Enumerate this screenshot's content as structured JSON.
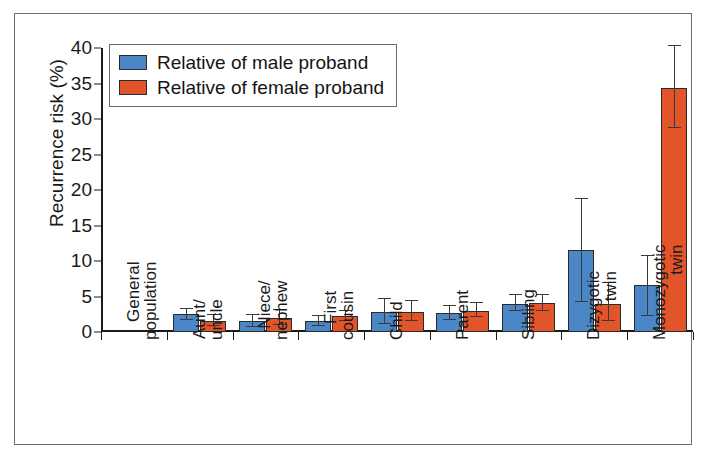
{
  "chart_data": {
    "type": "bar",
    "title": "",
    "subtitle": "",
    "xlabel": "",
    "ylabel": "Recurrence risk (%)",
    "ylim": [
      0,
      40
    ],
    "ytick_step": 5,
    "yticks": [
      "0",
      "5",
      "10",
      "15",
      "20",
      "25",
      "30",
      "35",
      "40"
    ],
    "grid": false,
    "legend_position": "top-left",
    "categories": [
      "General population",
      "Aunt/uncle",
      "Niece/nephew",
      "First cousin",
      "Child",
      "Parent",
      "Sibling",
      "Dizygotic twin",
      "Monozygotic twin"
    ],
    "category_lines": [
      [
        "General",
        "population"
      ],
      [
        "Aunt/",
        "uncle"
      ],
      [
        "Niece/",
        "nephew"
      ],
      [
        "First",
        "cousin"
      ],
      [
        "Child",
        ""
      ],
      [
        "Parent",
        ""
      ],
      [
        "Sibling",
        ""
      ],
      [
        "Dizygotic",
        "twin"
      ],
      [
        "Monozygotic",
        "twin"
      ]
    ],
    "series": [
      {
        "name": "Relative of male proband",
        "color": "#4b86c6",
        "values": [
          0,
          2.5,
          1.5,
          1.5,
          2.8,
          2.7,
          4.0,
          11.5,
          6.6
        ],
        "err_low": [
          0,
          1.7,
          0.7,
          0.9,
          1.1,
          1.7,
          2.9,
          4.2,
          2.3
        ],
        "err_high": [
          0,
          3.3,
          2.4,
          2.2,
          4.6,
          3.7,
          5.2,
          18.8,
          10.7
        ]
      },
      {
        "name": "Relative of female proband",
        "color": "#e2552a",
        "values": [
          0,
          1.5,
          2.0,
          2.3,
          2.8,
          3.0,
          4.1,
          4.0,
          34.4
        ],
        "err_low": [
          0,
          0.8,
          1.0,
          1.6,
          1.5,
          2.1,
          3.0,
          1.6,
          28.7
        ],
        "err_high": [
          0,
          2.4,
          3.1,
          3.0,
          4.4,
          4.1,
          5.2,
          6.9,
          40.3
        ]
      }
    ]
  },
  "legend": {
    "entries": [
      {
        "label": "Relative of male proband",
        "color": "#4b86c6"
      },
      {
        "label": "Relative of female proband",
        "color": "#e2552a"
      }
    ]
  },
  "axis": {
    "y_title": "Recurrence risk (%)"
  }
}
